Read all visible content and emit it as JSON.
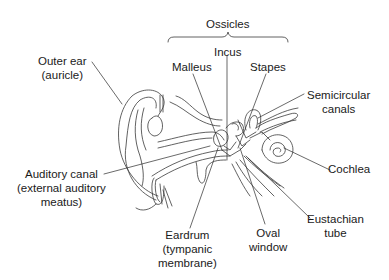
{
  "diagram": {
    "title": "Ossicles",
    "colors": {
      "line": "#3a3a3a",
      "text": "#1a1a1a",
      "background": "#ffffff"
    },
    "labels": {
      "ossicles": "Ossicles",
      "outer_ear": {
        "line1": "Outer ear",
        "line2": "(auricle)"
      },
      "malleus": "Malleus",
      "incus": "Incus",
      "stapes": "Stapes",
      "semicircular_canals": {
        "line1": "Semicircular",
        "line2": "canals"
      },
      "cochlea": "Cochlea",
      "auditory_canal": {
        "line1": "Auditory canal",
        "line2": "(external auditory",
        "line3": "meatus)"
      },
      "eardrum": {
        "line1": "Eardrum",
        "line2": "(tympanic",
        "line3": "membrane)"
      },
      "oval_window": {
        "line1": "Oval",
        "line2": "window"
      },
      "eustachian_tube": {
        "line1": "Eustachian",
        "line2": "tube"
      }
    }
  }
}
